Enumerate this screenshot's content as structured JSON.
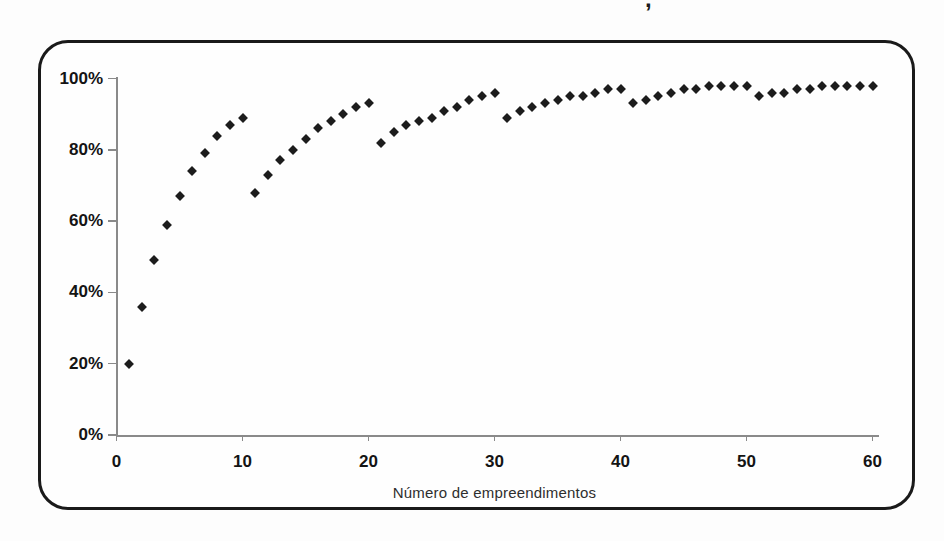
{
  "figure": {
    "cropped_title_fragment": ",",
    "background": "#fdfdfd",
    "frame_border_color": "#1a1a1a"
  },
  "chart_data": {
    "type": "scatter",
    "title": "",
    "xlabel": "Número de empreendimentos",
    "ylabel": "",
    "xlim": [
      0,
      60
    ],
    "ylim": [
      0,
      100
    ],
    "grid": false,
    "legend_position": "none",
    "axis_color": "#8a8a8a",
    "label_color": "#141414",
    "marker": {
      "shape": "diamond",
      "color": "#1c1c1c",
      "size_px": 7
    },
    "x_tick_values": [
      0,
      10,
      20,
      30,
      40,
      50,
      60
    ],
    "x_tick_labels": [
      "0",
      "10",
      "20",
      "30",
      "40",
      "50",
      "60"
    ],
    "y_tick_values": [
      0,
      20,
      40,
      60,
      80,
      100
    ],
    "y_tick_labels": [
      "0%",
      "20%",
      "40%",
      "60%",
      "80%",
      "100%"
    ],
    "x": [
      1,
      2,
      3,
      4,
      5,
      6,
      7,
      8,
      9,
      10,
      11,
      12,
      13,
      14,
      15,
      16,
      17,
      18,
      19,
      20,
      21,
      22,
      23,
      24,
      25,
      26,
      27,
      28,
      29,
      30,
      31,
      32,
      33,
      34,
      35,
      36,
      37,
      38,
      39,
      40,
      41,
      42,
      43,
      44,
      45,
      46,
      47,
      48,
      49,
      50,
      51,
      52,
      53,
      54,
      55,
      56,
      57,
      58,
      59,
      60
    ],
    "y": [
      20,
      36,
      49,
      59,
      67,
      74,
      79,
      84,
      87,
      89,
      68,
      73,
      77,
      80,
      83,
      86,
      88,
      90,
      92,
      93,
      82,
      85,
      87,
      88,
      89,
      91,
      92,
      94,
      95,
      96,
      89,
      91,
      92,
      93,
      94,
      95,
      95,
      96,
      97,
      97,
      93,
      94,
      95,
      96,
      97,
      97,
      98,
      98,
      98,
      98,
      95,
      96,
      96,
      97,
      97,
      98,
      98,
      98,
      98,
      98
    ]
  }
}
